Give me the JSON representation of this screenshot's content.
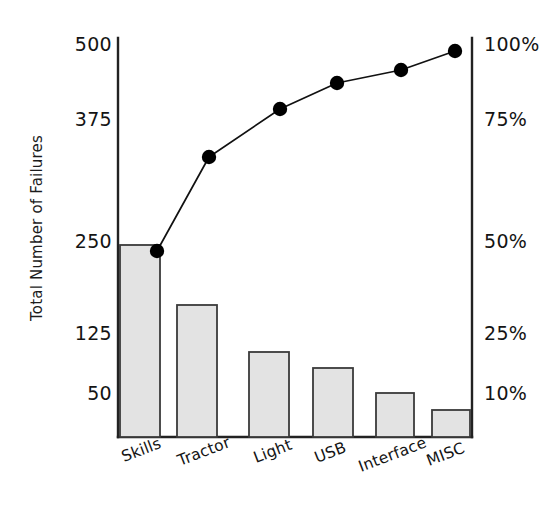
{
  "chart_data": {
    "type": "bar",
    "title": "",
    "subtitle": "",
    "xlabel": "",
    "ylabel": "Total Number of Failures",
    "y2label": "",
    "grid": false,
    "legend": "none",
    "categories": [
      "Skills",
      "Tractor",
      "Light",
      "USB",
      "Interface",
      "MISC"
    ],
    "values": [
      243,
      170,
      107,
      85,
      55,
      42
    ],
    "series": [
      {
        "name": "Total Number of Failures",
        "type": "bar",
        "axis": "left",
        "values": [
          243,
          170,
          107,
          85,
          55,
          42
        ]
      },
      {
        "name": "Cumulative Percentage",
        "type": "line",
        "axis": "right",
        "values": [
          48.6,
          68,
          82,
          88.5,
          94,
          100
        ]
      }
    ],
    "yticks": [
      50,
      125,
      250,
      375,
      500
    ],
    "yticklabels": [
      "50",
      "125",
      "250",
      "375",
      "500"
    ],
    "y2ticks": [
      10,
      25,
      50,
      75,
      100
    ],
    "y2ticklabels": [
      "10%",
      "25%",
      "50%",
      "75%",
      "100%"
    ],
    "ylim": [
      0,
      500
    ],
    "y2lim": [
      0,
      100
    ],
    "colors": {
      "bar_fill": "#e3e3e3",
      "bar_edge": "#3a3a3a",
      "line": "#111111",
      "marker": "#000000",
      "axis": "#222222",
      "text": "#141414",
      "background": "#ffffff"
    }
  },
  "axes": {
    "left_title": "Total Number of Failures",
    "left_ticks": [
      {
        "label": "500",
        "y": 46
      },
      {
        "label": "375",
        "y": 121
      },
      {
        "label": "250",
        "y": 243
      },
      {
        "label": "125",
        "y": 335
      },
      {
        "label": "50",
        "y": 395
      }
    ],
    "right_ticks": [
      {
        "label": "100%",
        "y": 46
      },
      {
        "label": "75%",
        "y": 121
      },
      {
        "label": "50%",
        "y": 243
      },
      {
        "label": "25%",
        "y": 335
      },
      {
        "label": "10%",
        "y": 395
      }
    ]
  },
  "categories_layout": [
    {
      "label": "Skills",
      "x": 119,
      "y": 449
    },
    {
      "label": "Tractor",
      "x": 175,
      "y": 453
    },
    {
      "label": "Light",
      "x": 251,
      "y": 450
    },
    {
      "label": "USB",
      "x": 312,
      "y": 450
    },
    {
      "label": "Interface",
      "x": 356,
      "y": 459
    },
    {
      "label": "MISC",
      "x": 424,
      "y": 453
    }
  ],
  "bars_layout": [
    {
      "name": "Skills",
      "x": 120,
      "y": 245,
      "w": 40,
      "h": 192
    },
    {
      "name": "Tractor",
      "x": 177,
      "y": 305,
      "w": 40,
      "h": 132
    },
    {
      "name": "Light",
      "x": 249,
      "y": 352,
      "w": 40,
      "h": 85
    },
    {
      "name": "USB",
      "x": 313,
      "y": 368,
      "w": 40,
      "h": 69
    },
    {
      "name": "Interface",
      "x": 376,
      "y": 393,
      "w": 38,
      "h": 44
    },
    {
      "name": "MISC",
      "x": 432,
      "y": 410,
      "w": 38,
      "h": 27
    }
  ],
  "line_points": [
    {
      "name": "Skills",
      "x": 157,
      "y": 251
    },
    {
      "name": "Tractor",
      "x": 209,
      "y": 157
    },
    {
      "name": "Light",
      "x": 280,
      "y": 109
    },
    {
      "name": "USB",
      "x": 337,
      "y": 83
    },
    {
      "name": "Interface",
      "x": 401,
      "y": 70
    },
    {
      "name": "MISC",
      "x": 455,
      "y": 51
    }
  ],
  "frame": {
    "left_axis_x": 118,
    "right_axis_x": 472,
    "top_y": 38,
    "baseline_y": 437
  }
}
